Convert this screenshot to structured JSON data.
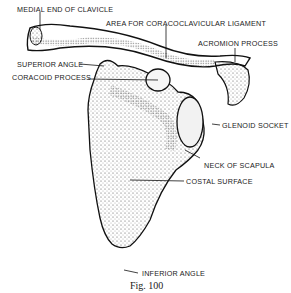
{
  "figure": {
    "caption": "Fig. 100",
    "labels": {
      "medial_end_of_clavicle": "MEDIAL END OF CLAVICLE",
      "area_for_coracoclavicular_ligament": "AREA FOR CORACOCLAVICULAR LIGAMENT",
      "acromion_process": "ACROMION PROCESS",
      "superior_angle": "SUPERIOR ANGLE",
      "coracoid_process": "CORACOID PROCESS",
      "glenoid_socket": "GLENOID SOCKET",
      "neck_of_scapula": "NECK OF SCAPULA",
      "costal_surface": "COSTAL SURFACE",
      "inferior_angle": "INFERIOR ANGLE"
    }
  },
  "colors": {
    "ink": "#1a1a1a",
    "background": "#ffffff"
  }
}
